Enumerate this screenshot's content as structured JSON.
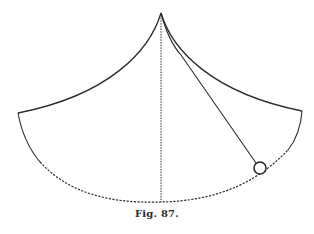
{
  "figure": {
    "caption": "Fig. 87.",
    "colors": {
      "ink": "#2a2a2a",
      "background": "#ffffff"
    },
    "elements": {
      "apex": [
        161,
        13
      ],
      "left_cusp": [
        18,
        113
      ],
      "right_cusp": [
        302,
        111
      ],
      "arc_bottom": [
        161,
        202
      ],
      "bob_center": [
        260,
        168
      ],
      "bob_radius": 6
    }
  }
}
